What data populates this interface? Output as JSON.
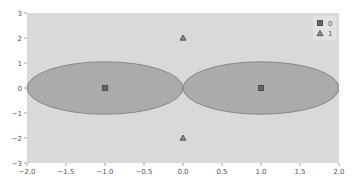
{
  "chart_data": {
    "type": "scatter",
    "title": "",
    "xlabel": "",
    "ylabel": "",
    "xlim": [
      -2.0,
      2.0
    ],
    "ylim": [
      -3,
      3
    ],
    "grid": false,
    "legend_position": "upper right",
    "x_ticks": [
      "-2.0",
      "-1.5",
      "-1.0",
      "-0.5",
      "0.0",
      "0.5",
      "1.0",
      "1.5",
      "2.0"
    ],
    "y_ticks": [
      "-3",
      "-2",
      "-1",
      "0",
      "1",
      "2",
      "3"
    ],
    "series": [
      {
        "name": "0",
        "marker": "square",
        "points": [
          [
            -1,
            0
          ],
          [
            1,
            0
          ]
        ]
      },
      {
        "name": "1",
        "marker": "triangle",
        "points": [
          [
            0,
            2
          ],
          [
            0,
            -2
          ]
        ]
      }
    ],
    "regions": [
      {
        "shape": "ellipse",
        "center": [
          -1,
          0
        ],
        "rx": 1.0,
        "ry": 1.05,
        "fill": "#a8a8a8"
      },
      {
        "shape": "ellipse",
        "center": [
          1,
          0
        ],
        "rx": 1.0,
        "ry": 1.05,
        "fill": "#a8a8a8"
      }
    ],
    "colors": {
      "background": "#d9d9d9",
      "region_fill": "#ababab",
      "region_edge": "#7a7a7a",
      "marker": "#444444"
    },
    "legend": [
      {
        "label": "0",
        "marker": "square"
      },
      {
        "label": "1",
        "marker": "triangle"
      }
    ]
  }
}
